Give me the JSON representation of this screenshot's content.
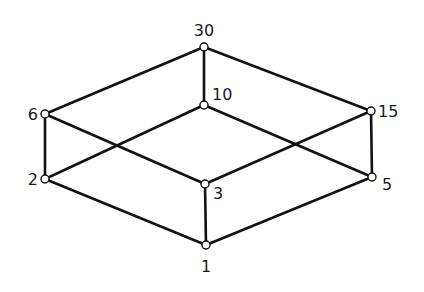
{
  "diagram": {
    "type": "hasse-diagram",
    "colors": {
      "line": "#111111",
      "node_fill": "#ffffff",
      "text": "#1a1a1a",
      "background": "#ffffff"
    },
    "nodes": [
      {
        "id": "30",
        "label": "30",
        "x": 204,
        "y": 47,
        "lx": 204,
        "ly": 36,
        "anchor": "middle"
      },
      {
        "id": "10",
        "label": "10",
        "x": 204,
        "y": 105,
        "lx": 212,
        "ly": 100,
        "anchor": "start"
      },
      {
        "id": "6",
        "label": "6",
        "x": 45,
        "y": 114,
        "lx": 38,
        "ly": 120,
        "anchor": "end"
      },
      {
        "id": "15",
        "label": "15",
        "x": 371,
        "y": 111,
        "lx": 378,
        "ly": 117,
        "anchor": "start"
      },
      {
        "id": "2",
        "label": "2",
        "x": 45,
        "y": 179,
        "lx": 38,
        "ly": 185,
        "anchor": "end"
      },
      {
        "id": "3",
        "label": "3",
        "x": 205,
        "y": 184,
        "lx": 213,
        "ly": 199,
        "anchor": "start"
      },
      {
        "id": "5",
        "label": "5",
        "x": 372,
        "y": 177,
        "lx": 382,
        "ly": 190,
        "anchor": "start"
      },
      {
        "id": "1",
        "label": "1",
        "x": 206,
        "y": 245,
        "lx": 206,
        "ly": 272,
        "anchor": "middle"
      }
    ],
    "edges": [
      [
        "30",
        "6"
      ],
      [
        "30",
        "10"
      ],
      [
        "30",
        "15"
      ],
      [
        "6",
        "2"
      ],
      [
        "6",
        "3"
      ],
      [
        "10",
        "2"
      ],
      [
        "10",
        "5"
      ],
      [
        "15",
        "3"
      ],
      [
        "15",
        "5"
      ],
      [
        "2",
        "1"
      ],
      [
        "3",
        "1"
      ],
      [
        "5",
        "1"
      ]
    ]
  }
}
